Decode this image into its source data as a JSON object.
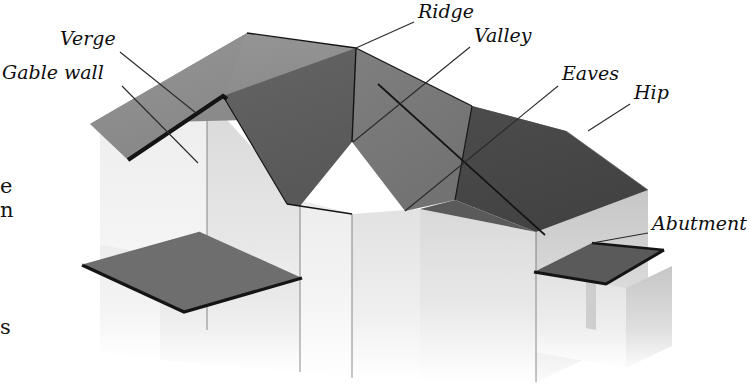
{
  "diagram": {
    "background_color": "#ffffff"
  },
  "labels": [
    {
      "id": "gable-wall",
      "text": "Gable wall",
      "x": 2,
      "y": 79,
      "anchor": "start"
    },
    {
      "id": "verge",
      "text": "Verge",
      "x": 60,
      "y": 45,
      "anchor": "start"
    },
    {
      "id": "ridge",
      "text": "Ridge",
      "x": 418,
      "y": 18,
      "anchor": "start"
    },
    {
      "id": "valley",
      "text": "Valley",
      "x": 474,
      "y": 42,
      "anchor": "start"
    },
    {
      "id": "eaves",
      "text": "Eaves",
      "x": 562,
      "y": 80,
      "anchor": "start"
    },
    {
      "id": "hip",
      "text": "Hip",
      "x": 634,
      "y": 99,
      "anchor": "start"
    },
    {
      "id": "abutment",
      "text": "Abutment",
      "x": 652,
      "y": 230,
      "anchor": "start"
    }
  ],
  "edge_text_fragments": [
    {
      "id": "frag-e",
      "text": "e",
      "x": 0,
      "y": 193
    },
    {
      "id": "frag-n",
      "text": "n",
      "x": 0,
      "y": 217
    },
    {
      "id": "frag-s",
      "text": "s",
      "x": 0,
      "y": 334
    }
  ],
  "leaders": [
    {
      "id": "leader-gable-wall",
      "from": [
        122,
        86
      ],
      "to": [
        198,
        163
      ]
    },
    {
      "id": "leader-verge",
      "from": [
        120,
        52
      ],
      "to": [
        196,
        113
      ]
    },
    {
      "id": "leader-ridge",
      "from": [
        414,
        22
      ],
      "to": [
        356,
        48
      ]
    },
    {
      "id": "leader-valley",
      "from": [
        470,
        47
      ],
      "to": [
        353,
        142
      ]
    },
    {
      "id": "leader-eaves",
      "from": [
        558,
        86
      ],
      "to": [
        405,
        211
      ]
    },
    {
      "id": "leader-hip",
      "from": [
        630,
        104
      ],
      "to": [
        588,
        131
      ]
    },
    {
      "id": "leader-abutment",
      "from": [
        648,
        233
      ],
      "to": [
        592,
        243
      ]
    }
  ],
  "palette": {
    "roof_light_gray": "#8f8f8f",
    "roof_mid_gray": "#7a7a7a",
    "roof_dark_gray": "#5e5e5e",
    "roof_darkest_gray": "#474747",
    "wall_lightest": "#f2f2f2",
    "wall_light": "#e4e4e4",
    "wall_mid": "#cfcfcf",
    "wall_shadow": "#bdbdbd",
    "outline": "#141414",
    "leader_line": "#2a2a2a",
    "text": "#0d0d0d"
  },
  "roof_planes": [
    {
      "id": "main-gable-left-slope",
      "label_ref": "verge",
      "shade": "#8f8f8f"
    },
    {
      "id": "main-front-slope",
      "label_ref": "eaves",
      "shade": "#5e5e5e"
    },
    {
      "id": "rear-slope",
      "label_ref": "ridge",
      "shade": "#8f8f8f"
    },
    {
      "id": "hip-end-slope",
      "label_ref": "hip",
      "shade": "#474747"
    },
    {
      "id": "valley-return-slope",
      "label_ref": "valley",
      "shade": "#7a7a7a"
    },
    {
      "id": "porch-canopy-roof",
      "label_ref": null,
      "shade": "#6e6e6e"
    },
    {
      "id": "abutment-lean-to-roof",
      "label_ref": "abutment",
      "shade": "#5a5a5a"
    }
  ]
}
